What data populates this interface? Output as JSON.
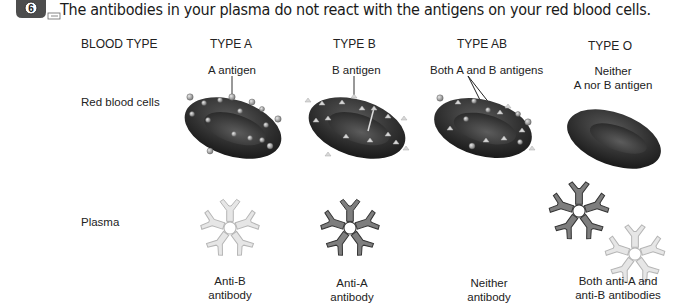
{
  "caption": {
    "step_number": "6",
    "text": "The antibodies in your plasma do not react with the antigens on your red blood cells."
  },
  "table": {
    "header_label": "BLOOD TYPE",
    "row_labels": {
      "cells": "Red blood cells",
      "plasma": "Plasma"
    },
    "columns": [
      {
        "type": "TYPE A",
        "antigen_label": [
          "A antigen"
        ],
        "antibody_label": [
          "Anti-B",
          "antibody"
        ],
        "antigens": "A",
        "antibodies": [
          "anti-B"
        ]
      },
      {
        "type": "TYPE B",
        "antigen_label": [
          "B antigen"
        ],
        "antibody_label": [
          "Anti-A",
          "antibody"
        ],
        "antigens": "B",
        "antibodies": [
          "anti-A"
        ]
      },
      {
        "type": "TYPE AB",
        "antigen_label": [
          "Both A and B antigens"
        ],
        "antibody_label": [
          "Neither",
          "antibody"
        ],
        "antigens": "A and B",
        "antibodies": []
      },
      {
        "type": "TYPE O",
        "antigen_label": [
          "Neither",
          "A nor B antigen"
        ],
        "antibody_label": [
          "Both anti-A and",
          "anti-B antibodies"
        ],
        "antigens": "none",
        "antibodies": [
          "anti-A",
          "anti-B"
        ]
      }
    ]
  },
  "colors": {
    "cell_dark": "#2b2b2b",
    "cell_mid": "#4a4a4a",
    "antigen_a": "#9a9a9a",
    "antigen_b": "#d8d8d8",
    "anti_a_antibody": "#7a7a7a",
    "anti_b_antibody": "#e2e2e2"
  }
}
